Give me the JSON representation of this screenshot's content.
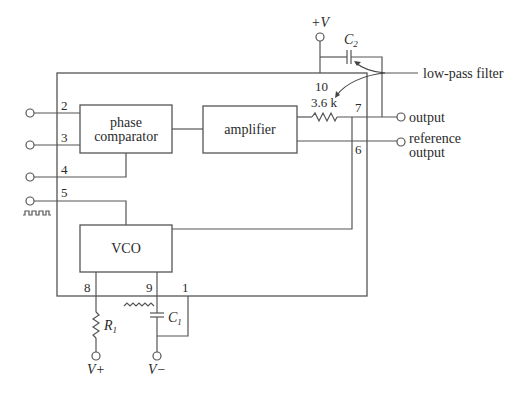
{
  "diagram": {
    "type": "PLL IC block diagram",
    "blocks": {
      "phase_comparator": [
        "phase",
        "comparator"
      ],
      "amplifier": "amplifier",
      "vco": "VCO"
    },
    "pins": {
      "p1": "1",
      "p2": "2",
      "p3": "3",
      "p4": "4",
      "p5": "5",
      "p6": "6",
      "p7": "7",
      "p8": "8",
      "p9": "9",
      "p10": "10"
    },
    "components": {
      "internal_resistor": "3.6 k",
      "c2_main": "C",
      "c2_sub": "2",
      "c1_main": "C",
      "c1_sub": "1",
      "r1_main": "R",
      "r1_sub": "1"
    },
    "supplies": {
      "top_plus_v": "+V",
      "v_plus": "V+",
      "v_minus": "V−"
    },
    "outputs": {
      "output": "output",
      "reference_output": [
        "reference",
        "output"
      ]
    },
    "annotations": {
      "low_pass_filter": "low-pass filter"
    }
  }
}
